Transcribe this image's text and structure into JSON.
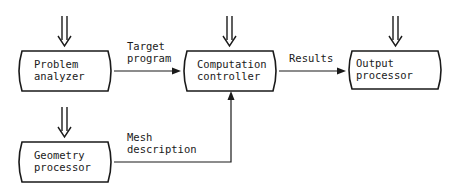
{
  "diagram": {
    "type": "block-flow",
    "colors": {
      "ink": "#1a1a1a",
      "background": "#ffffff"
    },
    "nodes": [
      {
        "id": "problem",
        "line1": "Problem",
        "line2": "analyzer"
      },
      {
        "id": "computation",
        "line1": "Computation",
        "line2": "controller"
      },
      {
        "id": "output",
        "line1": "Output",
        "line2": "processor"
      },
      {
        "id": "geometry",
        "line1": "Geometry",
        "line2": "processor"
      }
    ],
    "edges": [
      {
        "from": "problem",
        "to": "computation",
        "line1": "Target",
        "line2": "program"
      },
      {
        "from": "computation",
        "to": "output",
        "line1": "Results"
      },
      {
        "from": "geometry",
        "to": "computation",
        "line1": "Mesh",
        "line2": "description"
      }
    ],
    "inputs": [
      {
        "target": "problem",
        "icon": "double-down-arrow-icon"
      },
      {
        "target": "computation",
        "icon": "double-down-arrow-icon"
      },
      {
        "target": "output",
        "icon": "double-down-arrow-icon"
      },
      {
        "target": "geometry",
        "icon": "double-down-arrow-icon"
      }
    ]
  }
}
